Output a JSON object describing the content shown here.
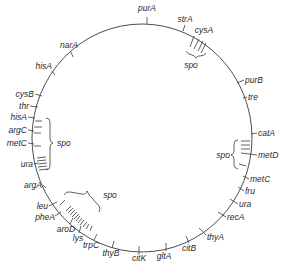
{
  "diagram": {
    "type": "circular genetic map",
    "genes": [
      {
        "name": "purA",
        "x": 147,
        "y": 11,
        "anchor": "middle"
      },
      {
        "name": "strA",
        "x": 185,
        "y": 22,
        "anchor": "middle"
      },
      {
        "name": "cysA",
        "x": 204,
        "y": 33,
        "anchor": "middle"
      },
      {
        "name": "purB",
        "x": 245,
        "y": 81,
        "anchor": "start"
      },
      {
        "name": "tre",
        "x": 246,
        "y": 98,
        "anchor": "start"
      },
      {
        "name": "catA",
        "x": 258,
        "y": 135,
        "anchor": "start"
      },
      {
        "name": "metD",
        "x": 258,
        "y": 156,
        "anchor": "start"
      },
      {
        "name": "metC",
        "x": 250,
        "y": 181,
        "anchor": "start"
      },
      {
        "name": "fru",
        "x": 246,
        "y": 193,
        "anchor": "start"
      },
      {
        "name": "ura",
        "x": 240,
        "y": 205,
        "anchor": "start"
      },
      {
        "name": "recA",
        "x": 227,
        "y": 218,
        "anchor": "start"
      },
      {
        "name": "thyA",
        "x": 207,
        "y": 238,
        "anchor": "start"
      },
      {
        "name": "citB",
        "x": 186,
        "y": 249,
        "anchor": "middle"
      },
      {
        "name": "gltA",
        "x": 163,
        "y": 256,
        "anchor": "middle"
      },
      {
        "name": "citK",
        "x": 138,
        "y": 258,
        "anchor": "middle"
      },
      {
        "name": "thyB",
        "x": 114,
        "y": 255,
        "anchor": "middle"
      },
      {
        "name": "trpC",
        "x": 94,
        "y": 247,
        "anchor": "middle"
      },
      {
        "name": "lys",
        "x": 79,
        "y": 241,
        "anchor": "middle"
      },
      {
        "name": "aroD",
        "x": 66,
        "y": 232,
        "anchor": "middle"
      },
      {
        "name": "pheA",
        "x": 53,
        "y": 219,
        "anchor": "end"
      },
      {
        "name": "leu",
        "x": 46,
        "y": 208,
        "anchor": "end"
      },
      {
        "name": "argA",
        "x": 42,
        "y": 187,
        "anchor": "end"
      },
      {
        "name": "ura",
        "x": 33,
        "y": 166,
        "anchor": "end"
      },
      {
        "name": "metC",
        "x": 27,
        "y": 146,
        "anchor": "end"
      },
      {
        "name": "argC",
        "x": 27,
        "y": 133,
        "anchor": "end"
      },
      {
        "name": "hisA",
        "x": 27,
        "y": 120,
        "anchor": "end"
      },
      {
        "name": "thr",
        "x": 29,
        "y": 109,
        "anchor": "end"
      },
      {
        "name": "cysB",
        "x": 34,
        "y": 97,
        "anchor": "end"
      },
      {
        "name": "hisA",
        "x": 52,
        "y": 71,
        "anchor": "end"
      },
      {
        "name": "narA",
        "x": 76,
        "y": 50,
        "anchor": "end"
      }
    ],
    "spo_regions": [
      {
        "label": "spo",
        "x": 187,
        "y": 67,
        "anchor": "middle"
      },
      {
        "label": "spo",
        "x": 254,
        "y": 156,
        "anchor": "end"
      },
      {
        "label": "spo",
        "x": 58,
        "y": 143,
        "anchor": "start"
      },
      {
        "label": "spo",
        "x": 96,
        "y": 200,
        "anchor": "middle"
      }
    ]
  }
}
